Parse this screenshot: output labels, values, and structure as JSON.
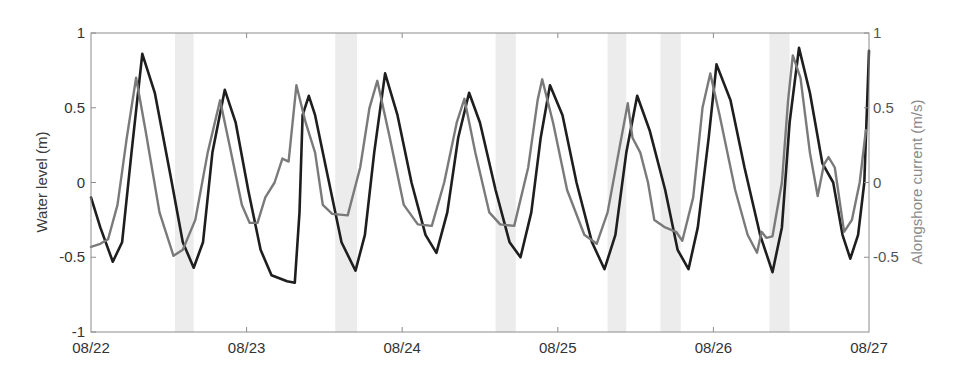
{
  "chart_data": {
    "type": "line",
    "title": "",
    "xlabel": "",
    "ylabel": "Water level (m)",
    "ylabel_right": "Alongshore current (m/s)",
    "x_tick_labels": [
      "08/22",
      "08/23",
      "08/24",
      "08/25",
      "08/26",
      "08/27"
    ],
    "x_range_days": [
      0,
      5
    ],
    "ylim": [
      -1,
      1
    ],
    "ylim_right": [
      -1,
      1
    ],
    "y_ticks": [
      {
        "value": 1,
        "label": "1"
      },
      {
        "value": 0.5,
        "label": "0.5"
      },
      {
        "value": 0,
        "label": "0"
      },
      {
        "value": -0.5,
        "label": "-0.5"
      },
      {
        "value": -1,
        "label": "-1"
      }
    ],
    "y_ticks_right": [
      {
        "value": 1,
        "label": "1"
      },
      {
        "value": 0.5,
        "label": "0.5"
      },
      {
        "value": 0,
        "label": "0"
      },
      {
        "value": -0.5,
        "label": "-0.5"
      }
    ],
    "grid": false,
    "legend": null,
    "shaded_bands_days": [
      [
        0.54,
        0.66
      ],
      [
        1.57,
        1.71
      ],
      [
        2.6,
        2.73
      ],
      [
        3.32,
        3.44
      ],
      [
        3.66,
        3.79
      ],
      [
        4.36,
        4.49
      ]
    ],
    "series": [
      {
        "name": "Water level (m)",
        "axis": "left",
        "color": "#1e1e1e",
        "width": 2.6,
        "x": [
          0.0,
          0.06,
          0.14,
          0.2,
          0.26,
          0.33,
          0.41,
          0.51,
          0.59,
          0.66,
          0.72,
          0.78,
          0.86,
          0.93,
          1.01,
          1.09,
          1.16,
          1.26,
          1.31,
          1.34,
          1.36,
          1.4,
          1.44,
          1.52,
          1.61,
          1.7,
          1.76,
          1.82,
          1.89,
          1.97,
          2.06,
          2.15,
          2.22,
          2.29,
          2.36,
          2.43,
          2.5,
          2.6,
          2.69,
          2.76,
          2.83,
          2.89,
          2.95,
          3.03,
          3.12,
          3.22,
          3.3,
          3.37,
          3.44,
          3.51,
          3.59,
          3.69,
          3.77,
          3.84,
          3.9,
          3.97,
          4.02,
          4.11,
          4.2,
          4.3,
          4.38,
          4.44,
          4.49,
          4.55,
          4.62,
          4.7,
          4.77,
          4.83,
          4.88,
          4.93,
          4.97,
          5.0
        ],
        "values": [
          -0.1,
          -0.3,
          -0.53,
          -0.4,
          0.2,
          0.86,
          0.6,
          0.05,
          -0.4,
          -0.57,
          -0.4,
          0.2,
          0.62,
          0.4,
          -0.05,
          -0.45,
          -0.62,
          -0.66,
          -0.67,
          -0.2,
          0.45,
          0.58,
          0.45,
          0.05,
          -0.4,
          -0.59,
          -0.35,
          0.2,
          0.73,
          0.45,
          0.0,
          -0.35,
          -0.47,
          -0.2,
          0.3,
          0.6,
          0.4,
          -0.05,
          -0.4,
          -0.5,
          -0.2,
          0.3,
          0.65,
          0.45,
          0.0,
          -0.4,
          -0.58,
          -0.35,
          0.2,
          0.58,
          0.35,
          -0.05,
          -0.45,
          -0.58,
          -0.3,
          0.3,
          0.79,
          0.55,
          0.1,
          -0.35,
          -0.6,
          -0.3,
          0.4,
          0.9,
          0.6,
          0.13,
          0.0,
          -0.35,
          -0.51,
          -0.35,
          0.0,
          0.88
        ]
      },
      {
        "name": "Alongshore current (m/s)",
        "axis": "right",
        "color": "#7a7a7a",
        "width": 2.4,
        "x": [
          0.0,
          0.06,
          0.11,
          0.17,
          0.23,
          0.29,
          0.35,
          0.44,
          0.53,
          0.59,
          0.67,
          0.75,
          0.83,
          0.89,
          0.97,
          1.02,
          1.07,
          1.12,
          1.18,
          1.23,
          1.27,
          1.32,
          1.38,
          1.44,
          1.49,
          1.55,
          1.65,
          1.73,
          1.79,
          1.84,
          1.92,
          2.01,
          2.1,
          2.19,
          2.27,
          2.35,
          2.4,
          2.47,
          2.56,
          2.63,
          2.72,
          2.81,
          2.87,
          2.9,
          2.97,
          3.06,
          3.17,
          3.25,
          3.32,
          3.4,
          3.45,
          3.48,
          3.53,
          3.58,
          3.62,
          3.69,
          3.76,
          3.8,
          3.87,
          3.93,
          3.98,
          4.04,
          4.14,
          4.22,
          4.28,
          4.31,
          4.34,
          4.38,
          4.44,
          4.48,
          4.51,
          4.56,
          4.62,
          4.67,
          4.71,
          4.74,
          4.78,
          4.84,
          4.89,
          4.94,
          4.98
        ],
        "values": [
          -0.43,
          -0.41,
          -0.38,
          -0.15,
          0.3,
          0.7,
          0.35,
          -0.2,
          -0.49,
          -0.45,
          -0.25,
          0.2,
          0.55,
          0.25,
          -0.15,
          -0.27,
          -0.27,
          -0.1,
          0.0,
          0.16,
          0.14,
          0.65,
          0.4,
          0.2,
          -0.15,
          -0.21,
          -0.22,
          0.1,
          0.5,
          0.68,
          0.3,
          -0.15,
          -0.28,
          -0.29,
          0.0,
          0.4,
          0.56,
          0.2,
          -0.2,
          -0.28,
          -0.29,
          0.1,
          0.55,
          0.69,
          0.4,
          -0.05,
          -0.35,
          -0.41,
          -0.2,
          0.25,
          0.53,
          0.3,
          0.2,
          0.0,
          -0.25,
          -0.3,
          -0.33,
          -0.39,
          -0.1,
          0.5,
          0.73,
          0.45,
          -0.05,
          -0.35,
          -0.47,
          -0.33,
          -0.37,
          -0.36,
          0.0,
          0.55,
          0.85,
          0.7,
          0.2,
          -0.09,
          0.12,
          0.17,
          0.1,
          -0.33,
          -0.25,
          0.0,
          0.35
        ]
      }
    ]
  },
  "colors": {
    "axis": "#8c8c8c",
    "band": "#ececec",
    "background": "#ffffff"
  }
}
